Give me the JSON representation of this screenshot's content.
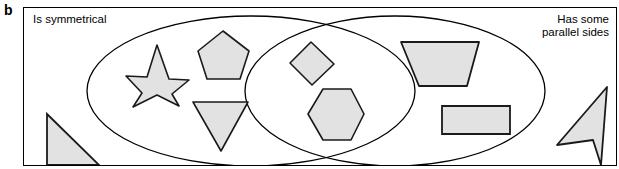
{
  "figure": {
    "letter": "b",
    "type": "venn-diagram",
    "width": 619,
    "height": 169
  },
  "sets": {
    "left": {
      "label": "Is symmetrical",
      "name": "is-symmetrical-set"
    },
    "right": {
      "label": "Has some\nparallel sides",
      "name": "has-parallel-sides-set"
    }
  },
  "style": {
    "shape_fill": "#e2e2e2",
    "shape_stroke": "#1a1a1a",
    "ellipse_stroke": "#000000",
    "frame_stroke": "#000000",
    "background": "#ffffff"
  },
  "shapes": [
    {
      "id": "star",
      "label": "five-pointed star",
      "region": "left-only",
      "points": "156,44 168,78 188,79 171,93 178,105 156,94 132,106 141,92 125,75 146,76"
    },
    {
      "id": "pentagon",
      "label": "pentagon",
      "region": "left-only",
      "points": "222,30 248,50 239,78 206,78 197,50"
    },
    {
      "id": "inverted-triangle",
      "label": "inverted triangle",
      "region": "left-only",
      "points": "192,101 247,101 220,150"
    },
    {
      "id": "diamond",
      "label": "diamond / rhombus",
      "region": "intersection",
      "points": "310,41 333,63 311,84 289,62"
    },
    {
      "id": "hexagon",
      "label": "hexagon",
      "region": "intersection",
      "points": "322,88 350,88 363,113 350,139 322,139 307,113"
    },
    {
      "id": "trapezoid",
      "label": "trapezoid",
      "region": "right-only",
      "points": "400,41 478,41 466,85 418,85"
    },
    {
      "id": "rectangle",
      "label": "rectangle",
      "region": "right-only",
      "points": "441,105 509,105 509,133 441,133"
    },
    {
      "id": "right-triangle",
      "label": "right-angled triangle",
      "region": "outside",
      "points": "46,113 98,164 46,164"
    },
    {
      "id": "dart",
      "label": "concave dart / arrowhead",
      "region": "outside",
      "points": "606,86 600,164 592,139 556,144"
    }
  ],
  "geometry": {
    "left_ellipse": {
      "cx": 250,
      "cy": 90,
      "rx": 164,
      "ry": 75
    },
    "right_ellipse": {
      "cx": 394,
      "cy": 90,
      "rx": 150,
      "ry": 75
    }
  }
}
